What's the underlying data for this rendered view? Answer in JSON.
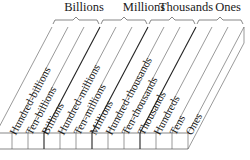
{
  "groups": [
    {
      "label": "Billions",
      "center_x": 84
    },
    {
      "label": "Millions",
      "center_x": 144
    },
    {
      "label": "Thousands",
      "center_x": 185
    },
    {
      "label": "Ones",
      "center_x": 226
    }
  ],
  "columns": [
    {
      "label": "Hundred-billions"
    },
    {
      "label": "Ten-billions"
    },
    {
      "label": "Billions"
    },
    {
      "label": "Hundred-millions"
    },
    {
      "label": "Ten-millions"
    },
    {
      "label": "Millions"
    },
    {
      "label": "Hundred-thousands"
    },
    {
      "label": "Ten-thousands"
    },
    {
      "label": "Thousands"
    },
    {
      "label": "Hundreds"
    },
    {
      "label": "Tens"
    },
    {
      "label": "Ones"
    }
  ],
  "colors": {
    "line": "#555555",
    "thick_line": "#222222",
    "text": "#1a1a1a"
  }
}
